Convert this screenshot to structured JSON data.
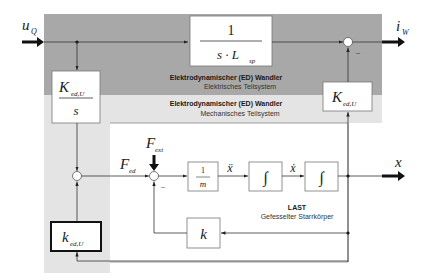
{
  "diagram": {
    "regions": {
      "electrical": {
        "title": "Elektrodynamischer (ED) Wandler",
        "subtitle": "Elektrisches Teilsystem",
        "color": "#a8a8a8"
      },
      "mechanical": {
        "title": "Elektrodynamischer (ED) Wandler",
        "subtitle": "Mechanisches Teilsystem",
        "color": "#e4e4e4"
      },
      "load": {
        "title": "LAST",
        "subtitle": "Gefesselter Starrkörper",
        "color": "#ffffff"
      }
    },
    "signals": {
      "input_voltage": {
        "base": "u",
        "sub": "Q"
      },
      "output_current": {
        "base": "i",
        "sub": "W"
      },
      "force_ed": {
        "base": "F",
        "sub": "ed"
      },
      "force_ext": {
        "base": "F",
        "sub": "ext"
      },
      "acceleration": "ẍ",
      "velocity": "ẋ",
      "position": "x"
    },
    "blocks": {
      "inductance": {
        "numerator": "1",
        "denominator_prefix": "s · L",
        "denominator_sub": "sp"
      },
      "k_ed_u_right": {
        "base": "K",
        "sub": "ed,U"
      },
      "k_ed_u_over_s": {
        "base": "K",
        "sub": "ed,U",
        "denominator": "s"
      },
      "inverse_mass": {
        "numerator": "1",
        "denominator": "m"
      },
      "integrator_1": "∫",
      "integrator_2": "∫",
      "stiffness": "k",
      "k_ed_u_lower": {
        "base": "k",
        "sub": "ed,U"
      }
    },
    "signs": {
      "sum_current_minus": "–",
      "sum_force_minus": "–"
    }
  }
}
